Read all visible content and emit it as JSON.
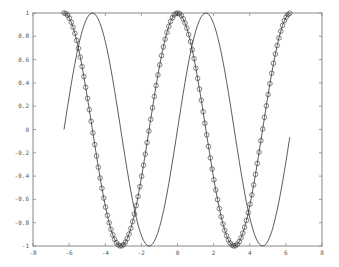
{
  "chart_data": {
    "type": "line",
    "title": "",
    "xlabel": "",
    "ylabel": "",
    "xlim": [
      -8,
      8
    ],
    "ylim": [
      -1,
      1
    ],
    "grid": false,
    "legend": null,
    "xticks": [
      -8,
      -6,
      -4,
      -2,
      0,
      2,
      4,
      6,
      8
    ],
    "yticks": [
      -1,
      -0.8,
      -0.6,
      -0.4,
      -0.2,
      0,
      0.2,
      0.4,
      0.6,
      0.8,
      1
    ],
    "xtick_labels": [
      "-8",
      "-6",
      "-4",
      "-2",
      "0",
      "2",
      "4",
      "6",
      "8"
    ],
    "ytick_labels": [
      "-1",
      "-0.8",
      "-0.6",
      "-0.4",
      "-0.2",
      "0",
      "0.2",
      "0.4",
      "0.6",
      "0.8",
      "1"
    ],
    "series": [
      {
        "name": "cos(x)",
        "style": "solid line with circle markers",
        "function": "cos",
        "x_start": -6.2832,
        "x_end": 6.2832,
        "x_step": 0.1,
        "color": "#333333"
      },
      {
        "name": "sin(x)",
        "style": "solid line",
        "function": "sin",
        "x_start": -6.2832,
        "x_end": 6.2168,
        "x_step": 0.1,
        "color": "#333333"
      }
    ]
  },
  "colors": {
    "axes": "#888888",
    "line": "#333333",
    "background": "#ffffff"
  }
}
